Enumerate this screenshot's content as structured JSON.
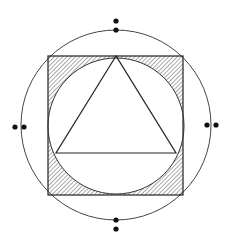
{
  "diagram": {
    "title": "",
    "colors": {
      "stroke": "#333333",
      "hatch": "#555555",
      "dots": "#111111",
      "background": "#ffffff"
    },
    "shapes": {
      "outer_circle": {
        "cx": 116,
        "cy": 125,
        "r": 95
      },
      "square": {
        "x": 48,
        "y": 56,
        "w": 135,
        "h": 139
      },
      "inner_circle": {
        "cx": 116,
        "cy": 126,
        "r": 68
      },
      "triangle": {
        "points": "116,56 56,153 176,153"
      }
    },
    "dot_pairs": [
      {
        "position": "top",
        "dots": [
          [
            116,
            21
          ],
          [
            116,
            30
          ]
        ]
      },
      {
        "position": "bottom",
        "dots": [
          [
            116,
            220
          ],
          [
            116,
            229
          ]
        ]
      },
      {
        "position": "left",
        "dots": [
          [
            15,
            127
          ],
          [
            24,
            127
          ]
        ]
      },
      {
        "position": "right",
        "dots": [
          [
            207,
            125
          ],
          [
            216,
            125
          ]
        ]
      }
    ]
  }
}
